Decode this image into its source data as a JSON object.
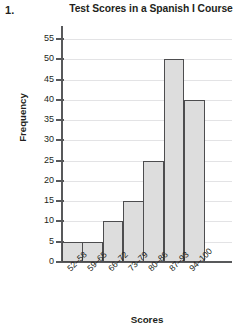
{
  "question_number": "1.",
  "chart_data": {
    "type": "bar",
    "title": "Test Scores in a Spanish I Course",
    "xlabel": "Scores",
    "ylabel": "Frequency",
    "categories": [
      "52–58",
      "59–65",
      "66–72",
      "73–79",
      "80–86",
      "87–93",
      "94–100"
    ],
    "values": [
      5,
      5,
      10,
      15,
      25,
      50,
      40
    ],
    "ylim": [
      0,
      55
    ],
    "ytick_values": [
      0,
      5,
      10,
      15,
      20,
      25,
      30,
      35,
      40,
      45,
      50,
      55
    ],
    "ytick_labels": [
      "0",
      "5",
      "10",
      "15",
      "20",
      "25",
      "30",
      "35",
      "40",
      "45",
      "50",
      "55"
    ],
    "grid": true,
    "legend": false,
    "bar_fill_color": "#dddddd",
    "bar_edge_color": "#4d4d4f",
    "gridline_color": "#e3e3e5",
    "axis_color": "#58595b",
    "text_color": "#231f20"
  }
}
